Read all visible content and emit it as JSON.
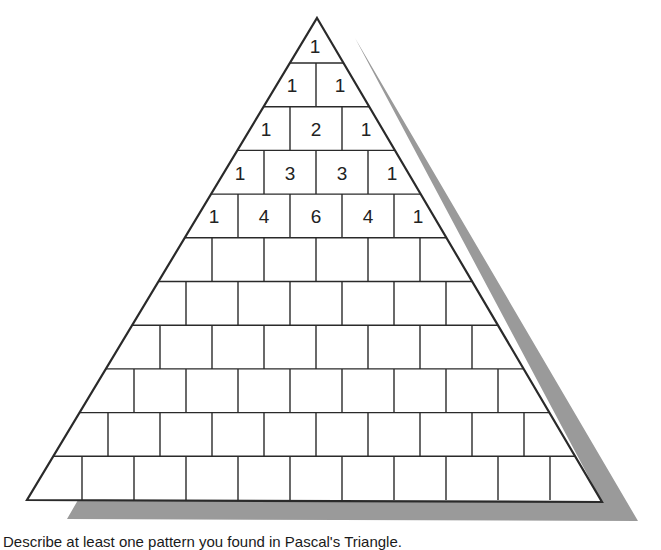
{
  "diagram": {
    "title": "Pascal's Triangle",
    "rows": 11,
    "apex": [
      317,
      18
    ],
    "base_left": [
      27,
      500
    ],
    "base_right": [
      602,
      502
    ],
    "row_top": 63,
    "row_height": 43.7,
    "cell_width": 52,
    "center_x": 316,
    "shadow_color": "#9a9a9a",
    "line_color": "#2a2a2a",
    "shadow_points": [
      [
        355,
        38
      ],
      [
        638,
        521
      ],
      [
        67,
        519
      ],
      [
        78,
        500
      ],
      [
        602,
        502
      ]
    ],
    "filled_rows": [
      [
        "1"
      ],
      [
        "1",
        "1"
      ],
      [
        "1",
        "2",
        "1"
      ],
      [
        "1",
        "3",
        "3",
        "1"
      ],
      [
        "1",
        "4",
        "6",
        "4",
        "1"
      ]
    ]
  },
  "prompt": {
    "text": "Describe at least one pattern you found in Pascal's Triangle."
  }
}
